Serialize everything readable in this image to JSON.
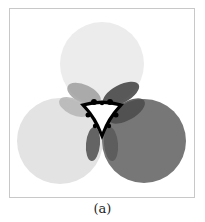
{
  "figure": {
    "caption": "(a)",
    "frame": {
      "x": 9,
      "y": 8,
      "width": 186,
      "height": 190,
      "border_color": "#c8c8c8"
    },
    "circles": [
      {
        "name": "top-circle",
        "cx": 102,
        "cy": 64,
        "r": 42,
        "fill": "#ececec"
      },
      {
        "name": "left-circle",
        "cx": 60,
        "cy": 141,
        "r": 43,
        "fill": "#e3e3e3"
      },
      {
        "name": "right-circle",
        "cx": 144,
        "cy": 141,
        "r": 42,
        "fill": "#777777"
      }
    ],
    "petals": [
      {
        "name": "petal-top-left",
        "cx": 84,
        "cy": 94,
        "rx": 18,
        "ry": 9,
        "rotate": 25,
        "fill": "#9a9a9a",
        "opacity": 0.8
      },
      {
        "name": "petal-top-right",
        "cx": 121,
        "cy": 94,
        "rx": 20,
        "ry": 9,
        "rotate": -28,
        "fill": "#3e3e3e",
        "opacity": 0.85
      },
      {
        "name": "petal-left-upper",
        "cx": 74,
        "cy": 107,
        "rx": 16,
        "ry": 8,
        "rotate": 25,
        "fill": "#b5b5b5",
        "opacity": 0.85
      },
      {
        "name": "petal-right-upper",
        "cx": 127,
        "cy": 111,
        "rx": 20,
        "ry": 9,
        "rotate": -30,
        "fill": "#4a4a4a",
        "opacity": 0.85
      },
      {
        "name": "petal-bottom-left",
        "cx": 93,
        "cy": 144,
        "rx": 7,
        "ry": 17,
        "rotate": 5,
        "fill": "#555555",
        "opacity": 0.9
      },
      {
        "name": "petal-bottom-right",
        "cx": 111,
        "cy": 144,
        "rx": 7,
        "ry": 17,
        "rotate": -5,
        "fill": "#5a5a5a",
        "opacity": 0.9
      }
    ],
    "center_hole": {
      "fill": "#ffffff",
      "outline": "#000000"
    }
  }
}
